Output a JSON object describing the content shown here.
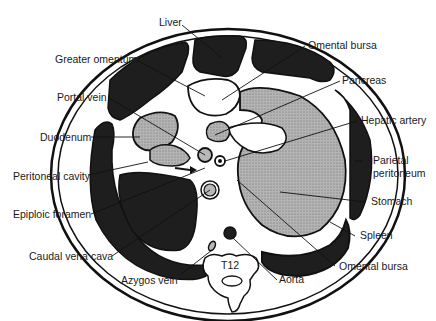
{
  "diagram": {
    "vertebra_label": "T12",
    "colors": {
      "dark_organ": "#1e1e1e",
      "stippled_organ": "#a8a8a8",
      "vessel": "#b8b8b8",
      "outline": "#111111",
      "background": "#ffffff"
    },
    "labels": {
      "liver": "Liver",
      "greater_omentum": "Greater omentum",
      "portal_vein": "Portal vein",
      "duodenum": "Duodenum",
      "peritoneal_cavity": "Peritoneal cavity",
      "epiploic_foramen": "Epiploic foramen",
      "caudal_vena_cava": "Caudal vena cava",
      "azygos_vein": "Azygos vein",
      "omental_bursa_top": "Omental bursa",
      "pancreas": "Pancreas",
      "hepatic_artery": "Hepatic artery",
      "parietal_peritoneum_1": "Parietal",
      "parietal_peritoneum_2": "peritoneum",
      "stomach": "Stomach",
      "spleen": "Spleen",
      "omental_bursa_bottom": "Omental bursa",
      "aorta": "Aorta"
    }
  }
}
